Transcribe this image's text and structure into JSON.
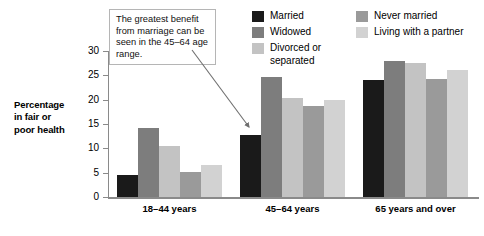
{
  "chart_data": {
    "type": "bar",
    "title": "",
    "subtitle": "",
    "xlabel": "",
    "ylabel": "Percentage\nin fair or\npoor health",
    "ylabel_lines": [
      "Percentage",
      "in fair or",
      "poor health"
    ],
    "ylim": [
      0,
      30
    ],
    "yticks": [
      0,
      5,
      10,
      15,
      20,
      25,
      30
    ],
    "ytick_labels": [
      "0",
      "5",
      "10",
      "15",
      "20",
      "25",
      "30"
    ],
    "grid": false,
    "legend_position": "top-right",
    "categories": [
      "18–44 years",
      "45–64 years",
      "65 years and over"
    ],
    "series": [
      {
        "name": "Married",
        "color": "#1a1a1a",
        "values": [
          4.5,
          12.7,
          24.0
        ]
      },
      {
        "name": "Widowed",
        "color": "#7d7d7d",
        "values": [
          14.1,
          24.7,
          28.0
        ]
      },
      {
        "name": "Divorced or separated",
        "color": "#c3c3c3",
        "values": [
          10.5,
          20.4,
          27.6
        ]
      },
      {
        "name": "Never married",
        "color": "#9a9a9a",
        "values": [
          5.2,
          18.6,
          24.2
        ]
      },
      {
        "name": "Living with a partner",
        "color": "#d2d2d2",
        "values": [
          6.6,
          20.0,
          26.0
        ]
      }
    ],
    "annotations": [
      {
        "text": "The greatest benefit from marriage can be seen in the 45–64 age range.",
        "points_to": "45–64 years / Married"
      }
    ]
  },
  "legend": {
    "columns": [
      {
        "items": [
          {
            "label": "Married",
            "color": "#1a1a1a"
          },
          {
            "label": "Widowed",
            "color": "#7d7d7d"
          },
          {
            "label": "Divorced or\nseparated",
            "color": "#c3c3c3"
          }
        ]
      },
      {
        "items": [
          {
            "label": "Never married",
            "color": "#9a9a9a"
          },
          {
            "label": "Living with a partner",
            "color": "#d2d2d2"
          }
        ]
      }
    ]
  },
  "callout": {
    "text": "The greatest benefit from marriage can be seen in the 45–64 age range."
  },
  "axis": {
    "y_title_line1": "Percentage",
    "y_title_line2": "in fair or",
    "y_title_line3": "poor health"
  }
}
